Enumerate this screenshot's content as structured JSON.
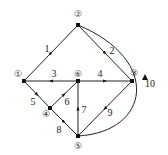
{
  "diagram": {
    "type": "directed-graph",
    "nodes": [
      {
        "id": "1",
        "label": "①",
        "x": 24,
        "y": 81,
        "lx": 18,
        "ly": 75
      },
      {
        "id": "2",
        "label": "②",
        "x": 78,
        "y": 25,
        "lx": 78,
        "ly": 15
      },
      {
        "id": "3",
        "label": "③",
        "x": 132,
        "y": 81,
        "lx": 134,
        "ly": 74
      },
      {
        "id": "4",
        "label": "④",
        "x": 50,
        "y": 108,
        "lx": 46,
        "ly": 115
      },
      {
        "id": "5",
        "label": "⑤",
        "x": 78,
        "y": 136,
        "lx": 78,
        "ly": 147
      },
      {
        "id": "6",
        "label": "⑥",
        "x": 78,
        "y": 81,
        "lx": 78,
        "ly": 75
      }
    ],
    "edges": [
      {
        "label": "1",
        "from": "1",
        "to": "2",
        "lx": 47,
        "ly": 50
      },
      {
        "label": "2",
        "from": "2",
        "to": "3",
        "lx": 112,
        "ly": 52
      },
      {
        "label": "3",
        "from": "6",
        "to": "1",
        "lx": 54,
        "ly": 75
      },
      {
        "label": "4",
        "from": "6",
        "to": "3",
        "lx": 100,
        "ly": 75
      },
      {
        "label": "5",
        "from": "1",
        "to": "4",
        "lx": 33,
        "ly": 103
      },
      {
        "label": "6",
        "from": "4",
        "to": "6",
        "lx": 67,
        "ly": 103
      },
      {
        "label": "7",
        "from": "5",
        "to": "6",
        "lx": 84,
        "ly": 111
      },
      {
        "label": "8",
        "from": "4",
        "to": "5",
        "lx": 59,
        "ly": 131
      },
      {
        "label": "9",
        "from": "3",
        "to": "5",
        "lx": 110,
        "ly": 114
      },
      {
        "label": "10",
        "from": "5",
        "to": "2",
        "lx": 150,
        "ly": 85
      }
    ]
  }
}
